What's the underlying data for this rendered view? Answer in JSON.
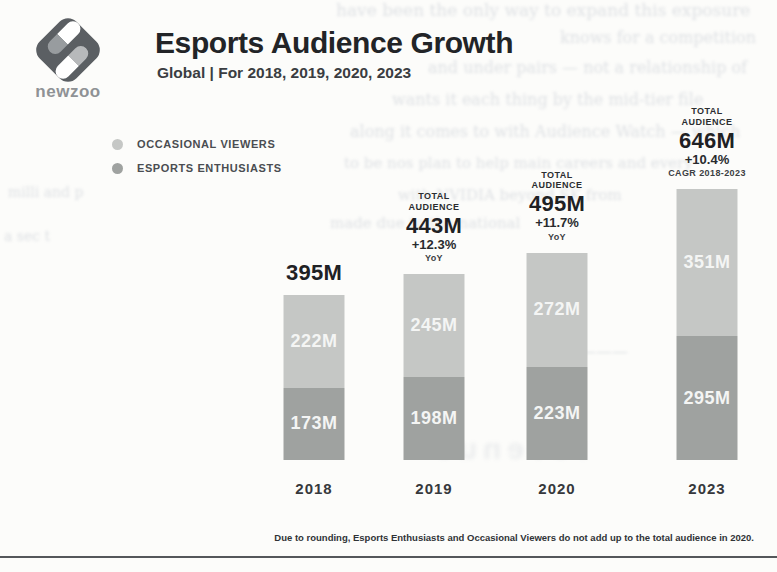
{
  "header": {
    "logo_text": "newzoo",
    "title": "Esports Audience Growth",
    "subtitle": "Global | For 2018, 2019, 2020, 2023"
  },
  "footnote": "Due to rounding, Esports Enthusiasts and Occasional Viewers do not add up to the total audience in 2020.",
  "colors": {
    "paper": "#fcfcfa",
    "logo_diamond": "#5b5f63",
    "occasional_viewers": "#c5c7c5",
    "esports_enthusiasts": "#9fa2a0",
    "bottom_rule": "#54575a"
  },
  "chart_data": {
    "type": "bar",
    "stacked": true,
    "title": "Esports Audience Growth",
    "subtitle": "Global | For 2018, 2019, 2020, 2023",
    "unit": "millions of viewers",
    "categories": [
      "2018",
      "2019",
      "2020",
      "2023"
    ],
    "series": [
      {
        "name": "OCCASIONAL VIEWERS",
        "values": [
          222,
          245,
          272,
          351
        ],
        "color": "#c5c7c5"
      },
      {
        "name": "ESPORTS ENTHUSIASTS",
        "values": [
          173,
          198,
          223,
          295
        ],
        "color": "#9fa2a0"
      }
    ],
    "totals": [
      395,
      443,
      495,
      646
    ],
    "ylim": [
      0,
      680
    ],
    "grid": false,
    "legend_position": "top-left",
    "bars": [
      {
        "year": "2018",
        "caption": "",
        "total_label": "395M",
        "delta": "",
        "delta_caption": "",
        "segment_labels": [
          "222M",
          "173M"
        ]
      },
      {
        "year": "2019",
        "caption": "TOTAL AUDIENCE",
        "total_label": "443M",
        "delta": "+12.3%",
        "delta_caption": "YoY",
        "segment_labels": [
          "245M",
          "198M"
        ]
      },
      {
        "year": "2020",
        "caption": "TOTAL AUDIENCE",
        "total_label": "495M",
        "delta": "+11.7%",
        "delta_caption": "YoY",
        "segment_labels": [
          "272M",
          "223M"
        ]
      },
      {
        "year": "2023",
        "caption": "TOTAL AUDIENCE",
        "total_label": "646M",
        "delta": "+10.4%",
        "delta_caption": "CAGR 2018-2023",
        "segment_labels": [
          "351M",
          "295M"
        ]
      }
    ]
  },
  "scan_bleed_through": {
    "lines": [
      {
        "text": "have been the only way to expand this exposure",
        "x": 336,
        "y": 0,
        "size": 17
      },
      {
        "text": "knows for a competition",
        "x": 560,
        "y": 28,
        "size": 16
      },
      {
        "text": "and under pairs — not a relationship of",
        "x": 428,
        "y": 58,
        "size": 16
      },
      {
        "text": "wants it each thing by the mid-tier file",
        "x": 392,
        "y": 90,
        "size": 16
      },
      {
        "text": "along it comes to with Audience Watch — which",
        "x": 350,
        "y": 122,
        "size": 16
      },
      {
        "text": "to be nos plan to help main careers and every",
        "x": 344,
        "y": 154,
        "size": 15
      },
      {
        "text": "with NVIDIA beyond SK from",
        "x": 398,
        "y": 186,
        "size": 15
      },
      {
        "text": "made due to the national",
        "x": 330,
        "y": 214,
        "size": 15
      },
      {
        "text": "milli and p",
        "x": 8,
        "y": 184,
        "size": 14
      },
      {
        "text": "a sec t",
        "x": 4,
        "y": 228,
        "size": 14
      },
      {
        "text": "———",
        "x": 580,
        "y": 342,
        "size": 16
      },
      {
        "text": "revenue",
        "x": 430,
        "y": 432,
        "size": 30,
        "big": true
      }
    ]
  }
}
